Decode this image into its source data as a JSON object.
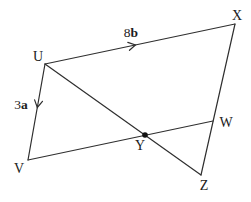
{
  "figure": {
    "canvas": {
      "width": 251,
      "height": 202,
      "background": "#ffffff"
    },
    "stroke": {
      "color": "#2f2f2f",
      "width": 1.2
    },
    "text_color": "#1c1c1c",
    "points": {
      "U": {
        "x": 45,
        "y": 64
      },
      "X": {
        "x": 235,
        "y": 24
      },
      "V": {
        "x": 28,
        "y": 160
      },
      "W": {
        "x": 213,
        "y": 121
      },
      "Z": {
        "x": 201,
        "y": 175
      },
      "Y": {
        "x": 145,
        "y": 135
      }
    },
    "segments": [
      {
        "id": "UX",
        "from": "U",
        "to": "X"
      },
      {
        "id": "UV",
        "from": "U",
        "to": "V"
      },
      {
        "id": "UZ",
        "from": "U",
        "to": "Z"
      },
      {
        "id": "VW",
        "from": "V",
        "to": "W"
      },
      {
        "id": "XZ",
        "from": "X",
        "to": "Z"
      }
    ],
    "vertex_labels": [
      {
        "point": "U",
        "text": "U",
        "x": 38,
        "y": 61
      },
      {
        "point": "X",
        "text": "X",
        "x": 237,
        "y": 20
      },
      {
        "point": "V",
        "text": "V",
        "x": 19,
        "y": 173
      },
      {
        "point": "W",
        "text": "W",
        "x": 226,
        "y": 127
      },
      {
        "point": "Y",
        "text": "Y",
        "x": 140,
        "y": 150
      },
      {
        "point": "Z",
        "text": "Z",
        "x": 204,
        "y": 190
      }
    ],
    "side_labels": [
      {
        "id": "label-8b",
        "segment": "UX",
        "normal": "8",
        "bold": "b",
        "x": 131,
        "y": 37
      },
      {
        "id": "label-3a",
        "segment": "UV",
        "normal": "3",
        "bold": "a",
        "x": 21,
        "y": 109
      }
    ],
    "direction_ticks": [
      {
        "segment": "UX",
        "x": 135,
        "y": 45,
        "angle": -11.9
      },
      {
        "segment": "UV",
        "x": 37.4,
        "y": 107,
        "angle": 100.0
      }
    ],
    "intersection_dot": {
      "point": "Y",
      "radius": 2.8,
      "color": "#111111"
    }
  }
}
